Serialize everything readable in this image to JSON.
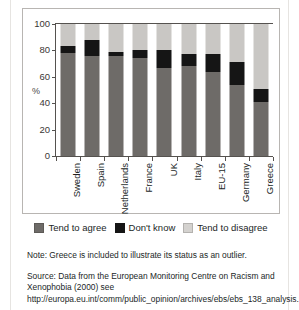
{
  "chart_data": {
    "type": "bar",
    "subtype": "stacked-vertical-100",
    "title": "",
    "xlabel": "",
    "ylabel": "%",
    "ylim": [
      0,
      100
    ],
    "yticks": [
      0,
      20,
      40,
      60,
      80,
      100
    ],
    "grid": false,
    "legend_position": "below-plot",
    "categories": [
      "Sweden",
      "Spain",
      "Netherlands",
      "France",
      "UK",
      "Italy",
      "EU-15",
      "Germany",
      "Greece"
    ],
    "series": [
      {
        "name": "Tend to agree",
        "color": "#6e6b68",
        "values": [
          78,
          76,
          76,
          74,
          67,
          68,
          64,
          54,
          41
        ]
      },
      {
        "name": "Don't know",
        "color": "#151515",
        "values": [
          5,
          12,
          3,
          6,
          13,
          9,
          13,
          17,
          10
        ]
      },
      {
        "name": "Tend to disagree",
        "color": "#c9c7c4",
        "values": [
          17,
          12,
          21,
          20,
          20,
          23,
          23,
          29,
          49
        ]
      }
    ]
  },
  "axis": {
    "y_label": "%",
    "y_ticks": [
      "100",
      "80",
      "60",
      "40",
      "20",
      "0"
    ],
    "x_labels": [
      "Sweden",
      "Spain",
      "Netherlands",
      "France",
      "UK",
      "Italy",
      "EU-15",
      "Germany",
      "Greece"
    ]
  },
  "legend": {
    "items": [
      {
        "label": "Tend to agree",
        "color": "#6e6b68"
      },
      {
        "label": "Don't know",
        "color": "#151515"
      },
      {
        "label": "Tend to disagree",
        "color": "#d4d2cf"
      }
    ]
  },
  "notes": {
    "note": "Note:  Greece is included to illustrate its status as an outlier.",
    "source": "Source:  Data from the European Monitoring Centre on Racism and Xenophobia (2000) see http://europa.eu.int/comm/public_opinion/archives/ebs/ebs_138_analysis.pdf."
  }
}
